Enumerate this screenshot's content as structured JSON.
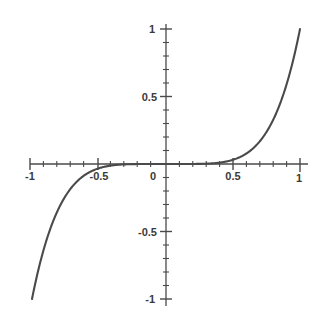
{
  "chart_data": {
    "type": "line",
    "title": "",
    "subtitle": "",
    "xlabel": "",
    "ylabel": "",
    "xlim": [
      -1,
      1
    ],
    "ylim": [
      -1,
      1
    ],
    "grid": false,
    "legend": false,
    "legend_position": "none",
    "axes_style": "centered-crosshair",
    "line_color": "#4a4a4a",
    "axis_color": "#4a4a4a",
    "line_width": 2.1,
    "function": "y = x^5",
    "x_ticks_major": [
      -1,
      -0.5,
      0,
      0.5,
      1
    ],
    "x_tick_labels": [
      "-1",
      "-0.5",
      "0",
      "0.5",
      "1"
    ],
    "y_ticks_major": [
      -1,
      -0.5,
      0.5,
      1
    ],
    "y_tick_labels": [
      "-1",
      "-0.5",
      "0.5",
      "1"
    ],
    "minor_tick_interval": 0.1,
    "series": [
      {
        "name": "y = x^5",
        "x": [
          -1,
          -0.95,
          -0.9,
          -0.85,
          -0.8,
          -0.75,
          -0.7,
          -0.65,
          -0.6,
          -0.55,
          -0.5,
          -0.45,
          -0.4,
          -0.35,
          -0.3,
          -0.25,
          -0.2,
          -0.15,
          -0.1,
          -0.05,
          0,
          0.05,
          0.1,
          0.15,
          0.2,
          0.25,
          0.3,
          0.35,
          0.4,
          0.45,
          0.5,
          0.55,
          0.6,
          0.65,
          0.7,
          0.75,
          0.8,
          0.85,
          0.9,
          0.95,
          1
        ],
        "y": [
          -1,
          -0.7738,
          -0.5905,
          -0.4437,
          -0.3277,
          -0.2373,
          -0.1681,
          -0.116,
          -0.0778,
          -0.0503,
          -0.0313,
          -0.0185,
          -0.0102,
          -0.0053,
          -0.0024,
          -0.001,
          -0.0003,
          -0.0001,
          0,
          0,
          0,
          0,
          0,
          0.0001,
          0.0003,
          0.001,
          0.0024,
          0.0053,
          0.0102,
          0.0185,
          0.0313,
          0.0503,
          0.0778,
          0.116,
          0.1681,
          0.2373,
          0.3277,
          0.4437,
          0.5905,
          0.7738,
          1
        ]
      }
    ]
  },
  "axis_labels": {
    "x_neg_one": "-1",
    "x_neg_half": "-0.5",
    "origin": "0",
    "x_half": "0.5",
    "x_one": "1",
    "y_one": "1",
    "y_half": "0.5",
    "y_neg_half": "-0.5",
    "y_neg_one": "-1"
  }
}
